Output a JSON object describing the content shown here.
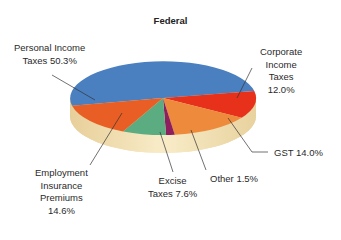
{
  "chart_data": {
    "type": "pie",
    "title": "Federal",
    "style": "3d-pie",
    "slices": [
      {
        "label": "Personal Income Taxes",
        "value": 50.3,
        "color": "#4a7fc0"
      },
      {
        "label": "Corporate Income Taxes",
        "value": 12.0,
        "color": "#e8311b"
      },
      {
        "label": "GST",
        "value": 14.0,
        "color": "#ee8a3c"
      },
      {
        "label": "Other",
        "value": 1.5,
        "color": "#8e1f5e"
      },
      {
        "label": "Excise Taxes",
        "value": 7.6,
        "color": "#5bac80"
      },
      {
        "label": "Employment Insurance Premiums",
        "value": 14.6,
        "color": "#e85e24"
      }
    ],
    "legend": "none (callout labels)",
    "rim_color": "#f3e2b6"
  },
  "labels": {
    "personal": [
      "Personal Income",
      "Taxes 50.3%"
    ],
    "corporate": [
      "Corporate",
      "Income",
      "Taxes",
      "12.0%"
    ],
    "gst": [
      "GST 14.0%"
    ],
    "other": [
      "Other 1.5%"
    ],
    "excise": [
      "Excise",
      "Taxes 7.6%"
    ],
    "employment": [
      "Employment",
      "Insurance",
      "Premiums",
      "14.6%"
    ]
  }
}
